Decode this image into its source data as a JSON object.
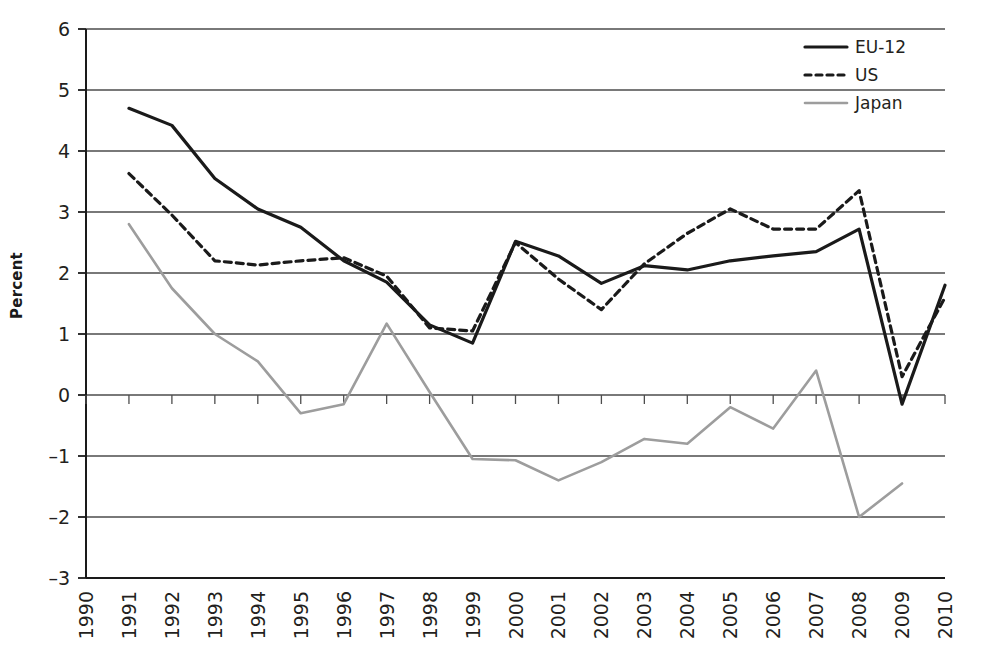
{
  "chart_data": {
    "type": "line",
    "title": "",
    "subtitle": "",
    "xlabel": "",
    "ylabel": "Percent",
    "xlim": [
      1990,
      2010
    ],
    "ylim": [
      -3,
      6
    ],
    "ytick_labels": [
      "6",
      "5",
      "4",
      "3",
      "2",
      "1",
      "0",
      "–1",
      "–2",
      "–3"
    ],
    "ytick_values": [
      6,
      5,
      4,
      3,
      2,
      1,
      0,
      -1,
      -2,
      -3
    ],
    "grid": "horizontal",
    "legend_position": "top-right",
    "x": [
      1990,
      1991,
      1992,
      1993,
      1994,
      1995,
      1996,
      1997,
      1998,
      1999,
      2000,
      2001,
      2002,
      2003,
      2004,
      2005,
      2006,
      2007,
      2008,
      2009,
      2010
    ],
    "xtick_labels": [
      "1990",
      "1991",
      "1992",
      "1993",
      "1994",
      "1995",
      "1996",
      "1997",
      "1998",
      "1999",
      "2000",
      "2001",
      "2002",
      "2003",
      "2004",
      "2005",
      "2006",
      "2007",
      "2008",
      "2009",
      "2010"
    ],
    "series": [
      {
        "name": "EU-12",
        "style": "solid",
        "color": "#1a1a1a",
        "width": 3.2,
        "values": [
          null,
          4.7,
          4.42,
          3.55,
          3.05,
          2.75,
          2.2,
          1.85,
          1.15,
          0.85,
          2.52,
          2.28,
          1.83,
          2.12,
          2.05,
          2.2,
          2.28,
          2.35,
          2.72,
          -0.15,
          1.8
        ]
      },
      {
        "name": "US",
        "style": "dashed",
        "color": "#1a1a1a",
        "width": 3.2,
        "values": [
          null,
          3.63,
          2.95,
          2.2,
          2.13,
          2.2,
          2.25,
          1.95,
          1.1,
          1.05,
          2.5,
          1.9,
          1.4,
          2.15,
          2.65,
          3.05,
          2.72,
          2.72,
          3.35,
          0.3,
          1.6
        ]
      },
      {
        "name": "Japan",
        "style": "solid",
        "color": "#9d9d9d",
        "width": 2.6,
        "values": [
          null,
          2.8,
          1.75,
          1.0,
          0.55,
          -0.3,
          -0.15,
          1.17,
          0.05,
          -1.05,
          -1.07,
          -1.4,
          -1.1,
          -0.72,
          -0.8,
          -0.2,
          -0.55,
          0.4,
          -2.0,
          -1.45,
          null
        ]
      }
    ]
  },
  "legend": {
    "items": [
      {
        "label": "EU-12",
        "swatch": "solid-black-line"
      },
      {
        "label": "US",
        "swatch": "dashed-black-line"
      },
      {
        "label": "Japan",
        "swatch": "solid-gray-line"
      }
    ]
  },
  "axis": {
    "y_title": "Percent"
  }
}
